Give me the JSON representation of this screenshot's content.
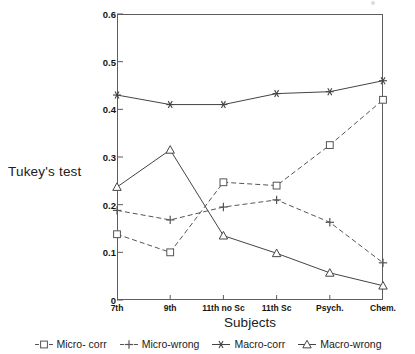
{
  "chart_data": {
    "type": "line",
    "title": "",
    "xlabel": "Subjects",
    "ylabel": "Tukey's test",
    "categories": [
      "7th",
      "9th",
      "11th no Sc",
      "11th Sc",
      "Psych.",
      "Chem."
    ],
    "ylim": [
      0,
      0.6
    ],
    "yticks": [
      "0",
      "0.1",
      "0.2",
      "0.3",
      "0.4",
      "0.5",
      "0.6"
    ],
    "ytick_values": [
      0,
      0.1,
      0.2,
      0.3,
      0.4,
      0.5,
      0.6
    ],
    "grid": false,
    "legend_position": "bottom",
    "series": [
      {
        "name": "Micro- corr",
        "marker": "square",
        "linestyle": "dashed",
        "color": "#555555",
        "values": [
          0.138,
          0.1,
          0.247,
          0.24,
          0.325,
          0.42
        ]
      },
      {
        "name": "Micro-wrong",
        "marker": "plus",
        "linestyle": "dashed",
        "color": "#555555",
        "values": [
          0.188,
          0.168,
          0.195,
          0.21,
          0.163,
          0.078
        ]
      },
      {
        "name": "Macro-corr",
        "marker": "asterisk",
        "linestyle": "solid",
        "color": "#444444",
        "values": [
          0.43,
          0.41,
          0.41,
          0.433,
          0.437,
          0.46
        ]
      },
      {
        "name": "Macro-wrong",
        "marker": "triangle",
        "linestyle": "solid",
        "color": "#444444",
        "values": [
          0.237,
          0.315,
          0.135,
          0.098,
          0.057,
          0.03
        ]
      }
    ]
  },
  "axes": {
    "y_title": "Tukey's test",
    "x_title": "Subjects"
  },
  "legend": {
    "entries": [
      {
        "label": "Micro- corr"
      },
      {
        "label": "Micro-wrong"
      },
      {
        "label": "Macro-corr"
      },
      {
        "label": "Macro-wrong"
      }
    ]
  }
}
